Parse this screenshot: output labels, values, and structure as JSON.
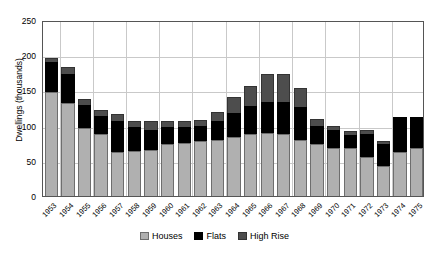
{
  "chart_data": {
    "type": "bar",
    "title": "",
    "subtitle": "",
    "xlabel": "",
    "ylabel": "Dwellings (thousands)",
    "ylim": [
      0,
      250
    ],
    "ytick_values": [
      0,
      50,
      100,
      150,
      200,
      250
    ],
    "ytick_labels": [
      "0",
      "50",
      "100",
      "150",
      "200",
      "250"
    ],
    "grid": "horizontal and vertical gridlines, light gray",
    "legend_position": "bottom-center",
    "stacked": true,
    "categories": [
      "1953",
      "1954",
      "1955",
      "1956",
      "1957",
      "1958",
      "1959",
      "1960",
      "1961",
      "1962",
      "1963",
      "1964",
      "1965",
      "1966",
      "1967",
      "1968",
      "1969",
      "1970",
      "1971",
      "1972",
      "1973",
      "1974",
      "1975"
    ],
    "series": [
      {
        "name": "Houses",
        "color": "#b0b0b0",
        "values": [
          148,
          132,
          96,
          88,
          62,
          64,
          66,
          74,
          76,
          78,
          80,
          84,
          88,
          90,
          88,
          80,
          74,
          68,
          68,
          56,
          42,
          62,
          68
        ]
      },
      {
        "name": "Flats",
        "color": "#000000",
        "values": [
          42,
          42,
          34,
          26,
          44,
          34,
          28,
          24,
          22,
          22,
          26,
          34,
          40,
          44,
          46,
          46,
          26,
          26,
          18,
          32,
          32,
          50,
          44
        ]
      },
      {
        "name": "High Rise",
        "color": "#4d4d4d",
        "values": [
          6,
          9,
          8,
          8,
          10,
          8,
          12,
          8,
          8,
          8,
          14,
          22,
          28,
          39,
          39,
          28,
          10,
          6,
          6,
          6,
          4,
          0,
          0
        ]
      }
    ],
    "totals": [
      196,
      183,
      138,
      122,
      116,
      106,
      106,
      106,
      106,
      108,
      120,
      140,
      156,
      173,
      173,
      154,
      110,
      100,
      92,
      94,
      78,
      112,
      112
    ]
  },
  "legend": {
    "items": [
      {
        "label": "Houses"
      },
      {
        "label": "Flats"
      },
      {
        "label": "High Rise"
      }
    ]
  }
}
